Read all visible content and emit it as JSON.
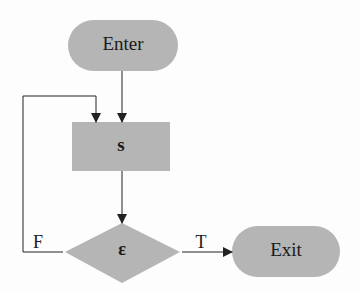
{
  "diagram": {
    "type": "flowchart",
    "nodes": {
      "enter": {
        "label": "Enter",
        "shape": "terminator"
      },
      "statement": {
        "label": "s",
        "shape": "process"
      },
      "condition": {
        "label": "ε",
        "shape": "decision"
      },
      "exit": {
        "label": "Exit",
        "shape": "terminator"
      }
    },
    "edges": {
      "false_label": "F",
      "true_label": "T"
    },
    "colors": {
      "node_fill": "#b5b5b5",
      "line": "#222222",
      "background": "#fdfdfd"
    }
  }
}
